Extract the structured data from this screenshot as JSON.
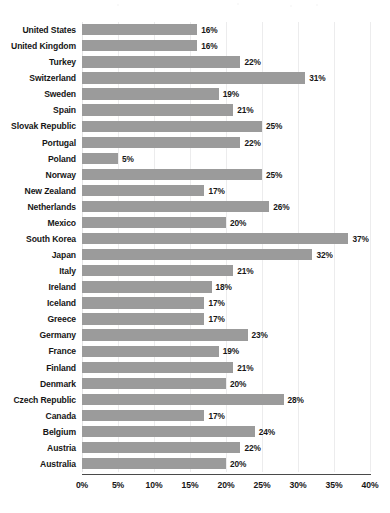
{
  "chart_data": {
    "type": "bar",
    "orientation": "horizontal",
    "title": "",
    "subtitle": "",
    "xlabel": "",
    "ylabel": "",
    "xlim": [
      0,
      40
    ],
    "xtick_labels": [
      "0%",
      "5%",
      "10%",
      "15%",
      "20%",
      "25%",
      "30%",
      "35%",
      "40%"
    ],
    "xtick_values": [
      0,
      5,
      10,
      15,
      20,
      25,
      30,
      35,
      40
    ],
    "grid": true,
    "legend": false,
    "value_label_suffix": "%",
    "bar_color": "#9b9b9b",
    "categories": [
      "United States",
      "United Kingdom",
      "Turkey",
      "Switzerland",
      "Sweden",
      "Spain",
      "Slovak Republic",
      "Portugal",
      "Poland",
      "Norway",
      "New Zealand",
      "Netherlands",
      "Mexico",
      "South Korea",
      "Japan",
      "Italy",
      "Ireland",
      "Iceland",
      "Greece",
      "Germany",
      "France",
      "Finland",
      "Denmark",
      "Czech Republic",
      "Canada",
      "Belgium",
      "Austria",
      "Australia"
    ],
    "values": [
      16,
      16,
      22,
      31,
      19,
      21,
      25,
      22,
      5,
      25,
      17,
      26,
      20,
      37,
      32,
      21,
      18,
      17,
      17,
      23,
      19,
      21,
      20,
      28,
      17,
      24,
      22,
      20
    ],
    "value_labels": [
      "16%",
      "16%",
      "22%",
      "31%",
      "19%",
      "21%",
      "25%",
      "22%",
      "5%",
      "25%",
      "17%",
      "26%",
      "20%",
      "37%",
      "32%",
      "21%",
      "18%",
      "17%",
      "17%",
      "23%",
      "19%",
      "21%",
      "20%",
      "28%",
      "17%",
      "24%",
      "22%",
      "20%"
    ]
  }
}
